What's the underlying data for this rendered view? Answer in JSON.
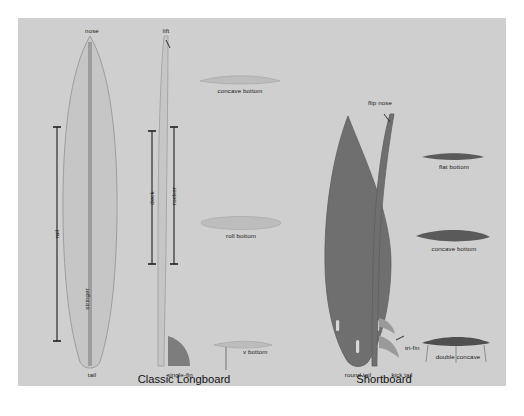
{
  "figure": {
    "background_color": "#ffffff",
    "panel_color": "#cfcfcf",
    "text_color": "#1a1a1a"
  },
  "longboard": {
    "title": "Classic Longboard",
    "deck_color": "#c6c6c6",
    "outline_color": "#9a9a9a",
    "stringer_color": "#9d9d9d",
    "fin_color": "#7d7d7d",
    "labels": {
      "nose": "nose",
      "tail": "tail",
      "rail": "rail",
      "stringer": "stringer",
      "deck": "deck",
      "rocker": "rocker",
      "lift": "lift",
      "single_fin": "single-fin"
    },
    "bottom_contours": [
      {
        "name": "concave bottom",
        "shape": "concave"
      },
      {
        "name": "roll bottom",
        "shape": "roll"
      },
      {
        "name": "v bottom",
        "shape": "v"
      }
    ]
  },
  "shortboard": {
    "title": "Shortboard",
    "deck_color": "#6f6f6f",
    "outline_color": "#5f5f5f",
    "fin_mark_color": "#d8d8d8",
    "labels": {
      "flip_nose": "flip nose",
      "round_tail": "round tail",
      "kick_tail": "kick tail",
      "tri_fin": "tri-fin"
    },
    "bottom_contours": [
      {
        "name": "flat bottom",
        "shape": "flat"
      },
      {
        "name": "concave bottom",
        "shape": "concave"
      },
      {
        "name": "double concave",
        "shape": "double-concave"
      }
    ]
  }
}
